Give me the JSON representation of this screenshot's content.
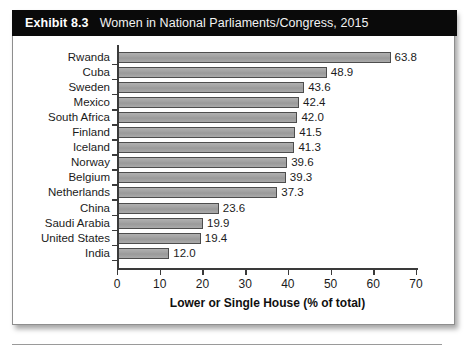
{
  "exhibit": {
    "number": "Exhibit 8.3",
    "title": "Women in National Parliaments/Congress, 2015"
  },
  "chart_data": {
    "type": "bar",
    "orientation": "horizontal",
    "title": "Women in National Parliaments/Congress, 2015",
    "subtitle": "",
    "xlabel": "Lower or Single House (% of total)",
    "ylabel": "",
    "xlim": [
      0,
      70
    ],
    "xticks": [
      0,
      10,
      20,
      30,
      40,
      50,
      60,
      70
    ],
    "xtick_labels": [
      "0",
      "10",
      "20",
      "30",
      "40",
      "50",
      "60",
      "70"
    ],
    "grid": false,
    "legend": false,
    "bar_color": "#a3a3a3",
    "bar_edge_color": "#4d4d4d",
    "categories": [
      "Rwanda",
      "Cuba",
      "Sweden",
      "Mexico",
      "South Africa",
      "Finland",
      "Iceland",
      "Norway",
      "Belgium",
      "Netherlands",
      "China",
      "Saudi Arabia",
      "United States",
      "India"
    ],
    "values": [
      63.8,
      48.9,
      43.6,
      42.4,
      42.0,
      41.5,
      41.3,
      39.6,
      39.3,
      37.3,
      23.6,
      19.9,
      19.4,
      12.0
    ],
    "value_labels": [
      "63.8",
      "48.9",
      "43.6",
      "42.4",
      "42.0",
      "41.5",
      "41.3",
      "39.6",
      "39.3",
      "37.3",
      "23.6",
      "19.9",
      "19.4",
      "12.0"
    ]
  }
}
